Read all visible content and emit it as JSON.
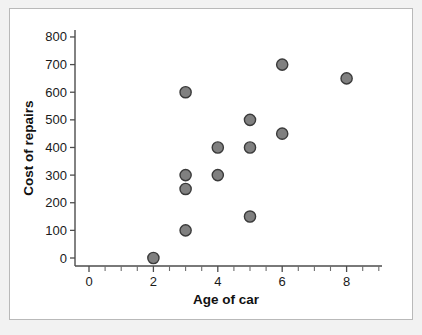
{
  "figure": {
    "background_color": "#f2f2f2",
    "panel_color": "#ffffff",
    "border_color": "#b9b9b9"
  },
  "chart_data": {
    "type": "scatter",
    "title": "",
    "xlabel": "Age of car",
    "ylabel": "Cost of repairs",
    "xlim": [
      -0.6,
      9.4
    ],
    "ylim": [
      -40,
      850
    ],
    "grid": false,
    "legend": null,
    "marker": {
      "shape": "circle",
      "fill_color": "#808080",
      "edge_color": "#3a3a3a",
      "radius_px": 5.6
    },
    "x_ticks_major": [
      0,
      2,
      4,
      6,
      8
    ],
    "x_tick_labels": [
      "0",
      "2",
      "4",
      "6",
      "8"
    ],
    "x_ticks_minor": [
      0.5,
      1,
      1.5,
      2.5,
      3,
      3.5,
      4.5,
      5,
      5.5,
      6.5,
      7,
      7.5,
      8.5,
      9
    ],
    "y_ticks_major": [
      0,
      100,
      200,
      300,
      400,
      500,
      600,
      700,
      800
    ],
    "y_tick_labels": [
      "0",
      "100",
      "200",
      "300",
      "400",
      "500",
      "600",
      "700",
      "800"
    ],
    "x": [
      2,
      3,
      3,
      3,
      3,
      4,
      4,
      5,
      5,
      5,
      6,
      6,
      8
    ],
    "y": [
      0,
      100,
      250,
      300,
      600,
      300,
      400,
      150,
      400,
      500,
      450,
      700,
      650
    ],
    "points": [
      {
        "x": 2,
        "y": 0
      },
      {
        "x": 3,
        "y": 100
      },
      {
        "x": 3,
        "y": 250
      },
      {
        "x": 3,
        "y": 300
      },
      {
        "x": 3,
        "y": 600
      },
      {
        "x": 4,
        "y": 300
      },
      {
        "x": 4,
        "y": 400
      },
      {
        "x": 5,
        "y": 150
      },
      {
        "x": 5,
        "y": 400
      },
      {
        "x": 5,
        "y": 500
      },
      {
        "x": 6,
        "y": 450
      },
      {
        "x": 6,
        "y": 700
      },
      {
        "x": 8,
        "y": 650
      }
    ]
  }
}
